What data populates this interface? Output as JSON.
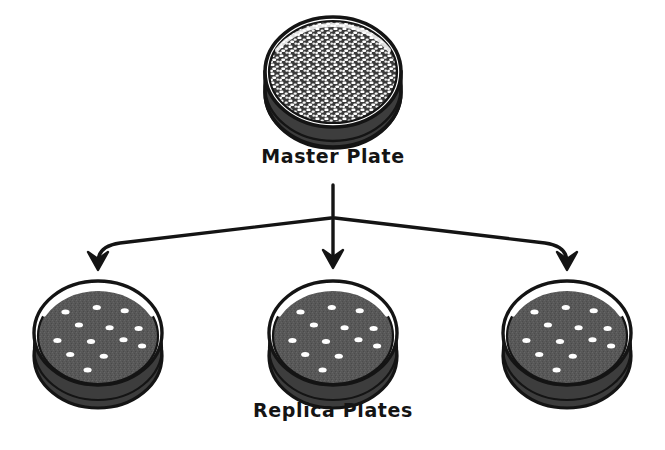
{
  "figure": {
    "background_color": "#ffffff",
    "ink_color": "#141414"
  },
  "labels": {
    "master": "Master Plate",
    "replica": "Replica Plates"
  },
  "colors": {
    "outline": "#141414",
    "rim_shadow": "#2a2a2a",
    "rim_highlight": "#f2f2f2",
    "agar_dense": "#3a3a3a",
    "agar_sparse": "#5a5a5a",
    "colony": "#ffffff",
    "arrow": "#141414"
  },
  "master_plate": {
    "name": "master-plate",
    "center_x": 333,
    "center_y": 72,
    "radius_x": 68,
    "radius_y": 55,
    "growth": "confluent",
    "colony_count": 420,
    "description": "Dense lawn of white colonies covering entire plate"
  },
  "replica_plates": [
    {
      "name": "replica-plate-left",
      "center_x": 98,
      "center_y": 333,
      "radius_x": 64,
      "radius_y": 52,
      "colony_count": 13
    },
    {
      "name": "replica-plate-center",
      "center_x": 333,
      "center_y": 333,
      "radius_x": 64,
      "radius_y": 52,
      "colony_count": 13
    },
    {
      "name": "replica-plate-right",
      "center_x": 567,
      "center_y": 333,
      "radius_x": 64,
      "radius_y": 52,
      "colony_count": 13
    }
  ],
  "colony_pattern": [
    {
      "x": -0.56,
      "y": -0.52
    },
    {
      "x": -0.02,
      "y": -0.62
    },
    {
      "x": 0.46,
      "y": -0.55
    },
    {
      "x": -0.33,
      "y": -0.24
    },
    {
      "x": 0.2,
      "y": -0.18
    },
    {
      "x": 0.7,
      "y": -0.16
    },
    {
      "x": -0.7,
      "y": 0.1
    },
    {
      "x": -0.12,
      "y": 0.12
    },
    {
      "x": 0.44,
      "y": 0.08
    },
    {
      "x": 0.76,
      "y": 0.22
    },
    {
      "x": -0.48,
      "y": 0.4
    },
    {
      "x": 0.1,
      "y": 0.44
    },
    {
      "x": -0.18,
      "y": 0.74
    }
  ],
  "arrows": {
    "name": "branching-arrows",
    "stem_start_y": 185,
    "junction_x": 333,
    "junction_y": 218,
    "arrow_tip_y": 268,
    "branches": [
      {
        "name": "arrow-to-left-replica",
        "target_x": 98
      },
      {
        "name": "arrow-to-center-replica",
        "target_x": 333
      },
      {
        "name": "arrow-to-right-replica",
        "target_x": 567
      }
    ]
  }
}
